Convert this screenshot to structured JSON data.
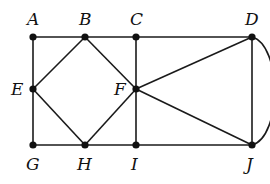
{
  "diagram": {
    "type": "graph",
    "vertices": [
      {
        "id": "A",
        "label": "A",
        "x": 33,
        "y": 37,
        "label_x": 27,
        "label_y": 25
      },
      {
        "id": "B",
        "label": "B",
        "x": 85,
        "y": 37,
        "label_x": 79,
        "label_y": 25
      },
      {
        "id": "C",
        "label": "C",
        "x": 136,
        "y": 37,
        "label_x": 130,
        "label_y": 25
      },
      {
        "id": "D",
        "label": "D",
        "x": 252,
        "y": 37,
        "label_x": 245,
        "label_y": 25
      },
      {
        "id": "E",
        "label": "E",
        "x": 33,
        "y": 89,
        "label_x": 11,
        "label_y": 95
      },
      {
        "id": "F",
        "label": "F",
        "x": 136,
        "y": 89,
        "label_x": 114,
        "label_y": 95
      },
      {
        "id": "G",
        "label": "G",
        "x": 33,
        "y": 145,
        "label_x": 26,
        "label_y": 170
      },
      {
        "id": "H",
        "label": "H",
        "x": 85,
        "y": 145,
        "label_x": 77,
        "label_y": 170
      },
      {
        "id": "I",
        "label": "I",
        "x": 136,
        "y": 145,
        "label_x": 131,
        "label_y": 170
      },
      {
        "id": "J",
        "label": "J",
        "x": 252,
        "y": 145,
        "label_x": 246,
        "label_y": 170
      }
    ],
    "edges": [
      {
        "from": "A",
        "to": "B"
      },
      {
        "from": "B",
        "to": "C"
      },
      {
        "from": "C",
        "to": "D"
      },
      {
        "from": "A",
        "to": "E"
      },
      {
        "from": "E",
        "to": "G"
      },
      {
        "from": "B",
        "to": "E"
      },
      {
        "from": "B",
        "to": "F"
      },
      {
        "from": "E",
        "to": "H"
      },
      {
        "from": "F",
        "to": "H"
      },
      {
        "from": "C",
        "to": "F"
      },
      {
        "from": "F",
        "to": "I"
      },
      {
        "from": "F",
        "to": "D"
      },
      {
        "from": "F",
        "to": "J"
      },
      {
        "from": "D",
        "to": "J"
      },
      {
        "from": "G",
        "to": "H"
      },
      {
        "from": "H",
        "to": "I"
      },
      {
        "from": "I",
        "to": "J"
      }
    ],
    "curved_edges": [
      {
        "from": "D",
        "to": "J",
        "bulge": "right"
      }
    ],
    "colors": {
      "stroke": "#1a1a1a",
      "vertex": "#111111",
      "background": "#ffffff"
    }
  }
}
